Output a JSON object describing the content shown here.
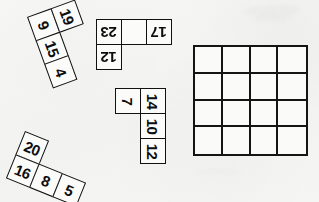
{
  "worksheet": {
    "title": "Number tile puzzle",
    "background_color": "#f5f5f3",
    "ink_color": "#111111",
    "pieces": [
      {
        "id": "piece-1",
        "name": "L-piece",
        "rotation_deg": -20,
        "cells": [
          {
            "label": "9",
            "row": 0,
            "col": 0,
            "text_rotation": 90
          },
          {
            "label": "19",
            "row": 0,
            "col": 1,
            "text_rotation": 90
          },
          {
            "label": "15",
            "row": 1,
            "col": 0,
            "text_rotation": 90
          },
          {
            "label": "4",
            "row": 2,
            "col": 0,
            "text_rotation": 90
          }
        ]
      },
      {
        "id": "piece-2",
        "name": "U-piece",
        "rotation_deg": 180,
        "cells": [
          {
            "label": "23",
            "row": 0,
            "col": 0,
            "text_rotation": 180
          },
          {
            "label": "17",
            "row": 0,
            "col": 2,
            "text_rotation": 180
          },
          {
            "label": "12",
            "row": 1,
            "col": 0,
            "text_rotation": 180
          }
        ]
      },
      {
        "id": "piece-3",
        "name": "J-piece",
        "rotation_deg": 0,
        "cells": [
          {
            "label": "7",
            "row": 0,
            "col": 0,
            "text_rotation": 90
          },
          {
            "label": "14",
            "row": 0,
            "col": 1,
            "text_rotation": 90
          },
          {
            "label": "10",
            "row": 1,
            "col": 1,
            "text_rotation": 90
          },
          {
            "label": "12",
            "row": 2,
            "col": 1,
            "text_rotation": 90
          }
        ]
      },
      {
        "id": "piece-4",
        "name": "S-piece",
        "rotation_deg": 22,
        "cells": [
          {
            "label": "20",
            "row": 0,
            "col": 0,
            "text_rotation": 0
          },
          {
            "label": "16",
            "row": 1,
            "col": 0,
            "text_rotation": 0
          },
          {
            "label": "8",
            "row": 1,
            "col": 1,
            "text_rotation": 0
          },
          {
            "label": "5",
            "row": 0,
            "col": 2,
            "text_rotation": 0
          }
        ]
      }
    ],
    "grid": {
      "name": "answer-grid",
      "rows": 4,
      "columns": 4,
      "values": [
        [
          "",
          "",
          "",
          ""
        ],
        [
          "",
          "",
          "",
          ""
        ],
        [
          "",
          "",
          "",
          ""
        ],
        [
          "",
          "",
          "",
          ""
        ]
      ]
    }
  }
}
